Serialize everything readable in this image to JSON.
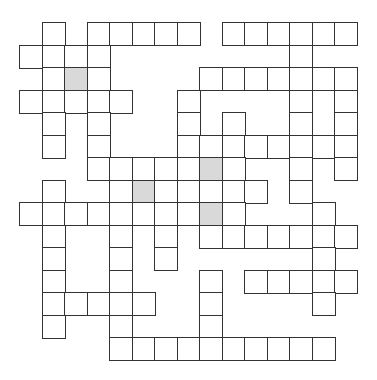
{
  "puzzle": {
    "type": "crossword-grid",
    "rows": 15,
    "cols": 15,
    "origin_x": 20,
    "origin_y": 23,
    "cell_size": 22.5,
    "colors": {
      "border": "#333333",
      "cell": "#ffffff",
      "shaded": "#d9d9d9",
      "background": "#ffffff"
    },
    "grid_rows": [
      {
        "row": 0,
        "cells": [
          1,
          3,
          4,
          5,
          6,
          7,
          9,
          10,
          11,
          12,
          13,
          14
        ],
        "shaded": []
      },
      {
        "row": 1,
        "cells": [
          0,
          1,
          2,
          3,
          12
        ],
        "shaded": []
      },
      {
        "row": 2,
        "cells": [
          1,
          2,
          3,
          8,
          9,
          10,
          11,
          12,
          13,
          14
        ],
        "shaded": [
          2
        ]
      },
      {
        "row": 3,
        "cells": [
          0,
          1,
          2,
          3,
          4,
          7,
          12,
          14
        ],
        "shaded": []
      },
      {
        "row": 4,
        "cells": [
          1,
          3,
          7,
          9,
          12,
          14
        ],
        "shaded": []
      },
      {
        "row": 5,
        "cells": [
          1,
          3,
          7,
          8,
          9,
          10,
          11,
          12,
          13,
          14
        ],
        "shaded": []
      },
      {
        "row": 6,
        "cells": [
          3,
          4,
          5,
          6,
          7,
          8,
          9,
          12,
          14
        ],
        "shaded": [
          8
        ]
      },
      {
        "row": 7,
        "cells": [
          1,
          4,
          5,
          6,
          7,
          8,
          9,
          10,
          12
        ],
        "shaded": [
          5
        ]
      },
      {
        "row": 8,
        "cells": [
          0,
          1,
          2,
          3,
          4,
          5,
          6,
          7,
          8,
          9,
          13
        ],
        "shaded": [
          8
        ]
      },
      {
        "row": 9,
        "cells": [
          1,
          4,
          6,
          8,
          9,
          10,
          11,
          12,
          13,
          14
        ],
        "shaded": []
      },
      {
        "row": 10,
        "cells": [
          1,
          4,
          6,
          13
        ],
        "shaded": []
      },
      {
        "row": 11,
        "cells": [
          1,
          4,
          8,
          10,
          11,
          12,
          13,
          14
        ],
        "shaded": []
      },
      {
        "row": 12,
        "cells": [
          1,
          2,
          3,
          4,
          5,
          8,
          13
        ],
        "shaded": []
      },
      {
        "row": 13,
        "cells": [
          1,
          4,
          8
        ],
        "shaded": []
      },
      {
        "row": 14,
        "cells": [
          4,
          5,
          6,
          7,
          8,
          9,
          10,
          11,
          12,
          13
        ],
        "shaded": []
      }
    ]
  }
}
